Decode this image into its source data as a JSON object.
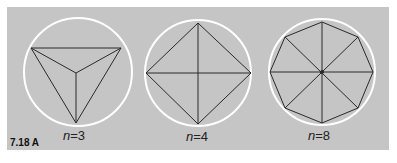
{
  "figure": {
    "id_label": "7.18 A",
    "background": "#c5c5c5",
    "circle_color": "#ffffff",
    "line_color": "#2a2a2a",
    "panels": [
      {
        "n": 3,
        "label_var": "n",
        "label_eq": "=3",
        "cx": 78,
        "cy": 72,
        "r": 54
      },
      {
        "n": 4,
        "label_var": "n",
        "label_eq": "=4",
        "cx": 198,
        "cy": 73,
        "r": 53
      },
      {
        "n": 8,
        "label_var": "n",
        "label_eq": "=8",
        "cx": 322,
        "cy": 72,
        "r": 53
      }
    ]
  }
}
